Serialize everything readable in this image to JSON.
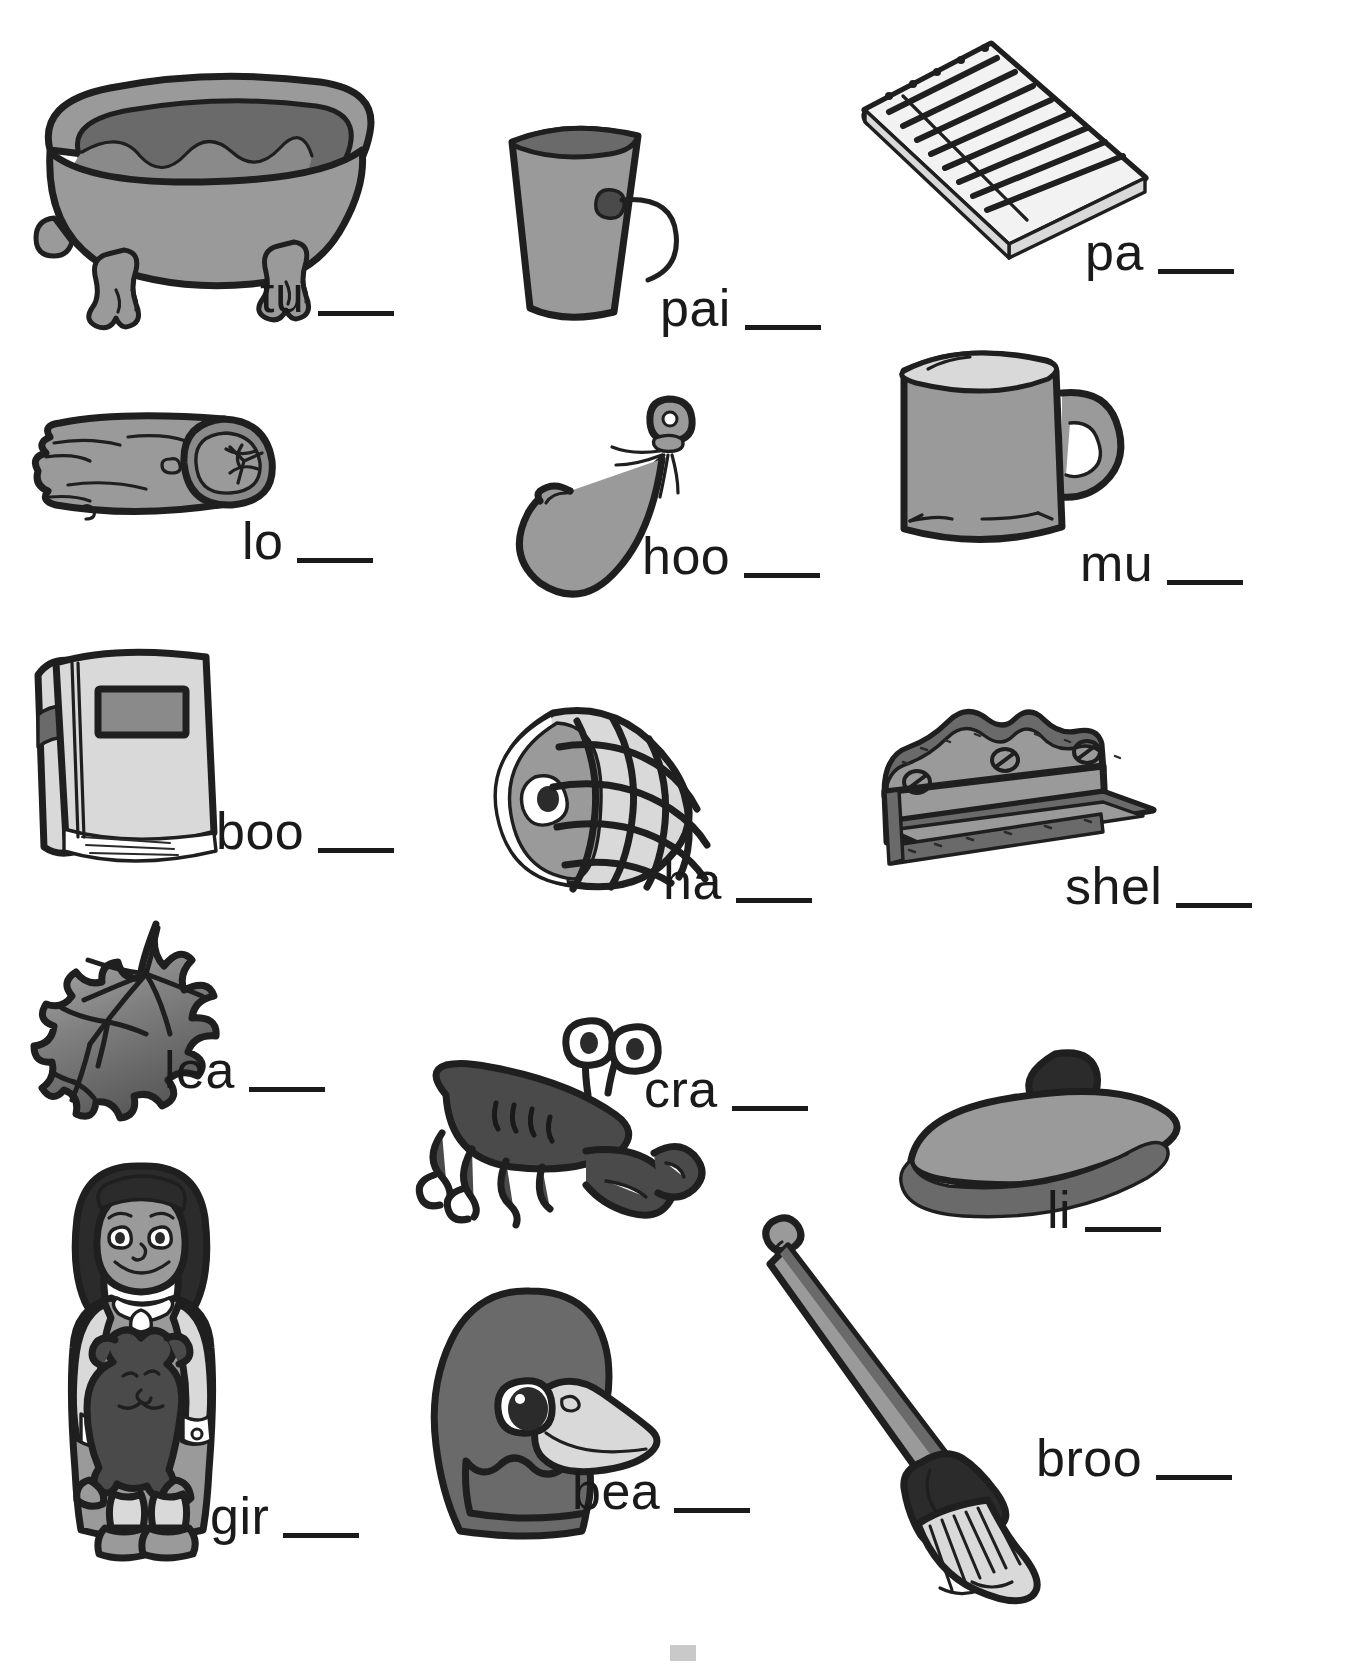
{
  "worksheet": {
    "page_type": "phonics-picture-word-worksheet",
    "background_color": "#ffffff",
    "text_color": "#1a1a1a",
    "blank_count_per_item": 1,
    "columns": 3,
    "rows": 5,
    "items": [
      {
        "id": "tub",
        "picture": "bathtub-with-water-and-faucet",
        "prefix": "tu",
        "blank": "___"
      },
      {
        "id": "pail",
        "picture": "metal-pail-bucket-with-handle",
        "prefix": "pai",
        "blank": "___"
      },
      {
        "id": "pad",
        "picture": "spiral-lined-notepad",
        "prefix": "pa",
        "blank": "___"
      },
      {
        "id": "log",
        "picture": "cut-wooden-log",
        "prefix": "lo",
        "blank": "___"
      },
      {
        "id": "hook",
        "picture": "fishing-hook-with-lure",
        "prefix": "hoo",
        "blank": "___"
      },
      {
        "id": "mug",
        "picture": "coffee-mug-with-handle",
        "prefix": "mu",
        "blank": "___"
      },
      {
        "id": "book",
        "picture": "hardcover-book-standing",
        "prefix": "boo",
        "blank": "___"
      },
      {
        "id": "ham",
        "picture": "netted-ham-joint",
        "prefix": "ha",
        "blank": "___"
      },
      {
        "id": "shelf",
        "picture": "wooden-wall-shelf-with-screws",
        "prefix": "shel",
        "blank": "___"
      },
      {
        "id": "leaf",
        "picture": "maple-leaf",
        "prefix": "lea",
        "blank": "___"
      },
      {
        "id": "crab",
        "picture": "crab-with-claws-and-eyestalks",
        "prefix": "cra",
        "blank": "___"
      },
      {
        "id": "lid",
        "picture": "pot-lid-with-knob",
        "prefix": "li",
        "blank": "___"
      },
      {
        "id": "girl",
        "picture": "girl-holding-teddy-bear",
        "prefix": "gir",
        "blank": "___"
      },
      {
        "id": "beak",
        "picture": "duck-head-showing-beak",
        "prefix": "bea",
        "blank": "___"
      },
      {
        "id": "broom",
        "picture": "broom-with-long-handle",
        "prefix": "broo",
        "blank": "___"
      }
    ]
  }
}
